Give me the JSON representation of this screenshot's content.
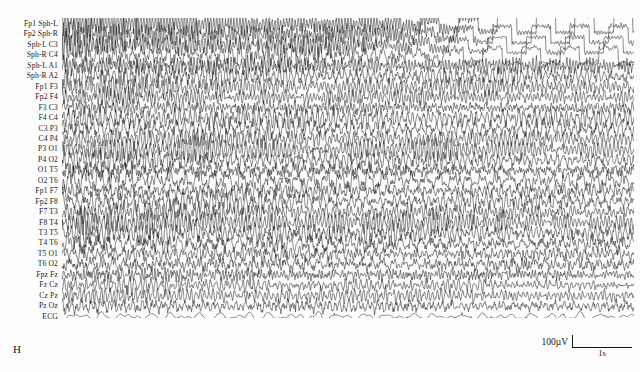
{
  "figure": {
    "panel_letter": "H",
    "modality": "EEG",
    "background_color": "#fdfdfd",
    "trace_color": "#1a1a1a"
  },
  "channels": [
    {
      "label": "Fp1 Sph-L"
    },
    {
      "label": "Fp2 Sph-R"
    },
    {
      "label": "Sph-L C3"
    },
    {
      "label": "Sph-R C4"
    },
    {
      "label": "Sph-L A1"
    },
    {
      "label": "Sph-R A2"
    },
    {
      "label": "Fp1 F3"
    },
    {
      "label": "Fp2 F4"
    },
    {
      "label": "F3 C3"
    },
    {
      "label": "F4 C4"
    },
    {
      "label": "C3 P3"
    },
    {
      "label": "C4 P4"
    },
    {
      "label": "P3 O1"
    },
    {
      "label": "P4 O2"
    },
    {
      "label": "O1 T5"
    },
    {
      "label": "O2 T6"
    },
    {
      "label": "Fp1 F7"
    },
    {
      "label": "Fp2 F8"
    },
    {
      "label": "F7 T3"
    },
    {
      "label": "F8 T4"
    },
    {
      "label": "T3 T5"
    },
    {
      "label": "T4 T6"
    },
    {
      "label": "T5 O1"
    },
    {
      "label": "T6 O2"
    },
    {
      "label": "Fpz Fz"
    },
    {
      "label": "Fz Cz"
    },
    {
      "label": "Cz Pz"
    },
    {
      "label": "Pz Oz"
    },
    {
      "label": "ECG"
    }
  ],
  "scale_bar": {
    "amplitude_label": "100µV",
    "time_label": "1s",
    "amplitude_value": 100,
    "amplitude_unit": "µV",
    "time_value": 1,
    "time_unit": "s"
  },
  "chart_data": {
    "type": "line",
    "title": "",
    "xlabel": "",
    "ylabel": "",
    "n_channels": 29,
    "epoch_seconds": 9.5,
    "series_labels": [
      "Fp1 Sph-L",
      "Fp2 Sph-R",
      "Sph-L C3",
      "Sph-R C4",
      "Sph-L A1",
      "Sph-R A2",
      "Fp1 F3",
      "Fp2 F4",
      "F3 C3",
      "F4 C4",
      "C3 P3",
      "C4 P4",
      "P3 O1",
      "P4 O2",
      "O1 T5",
      "O2 T6",
      "Fp1 F7",
      "Fp2 F8",
      "F7 T3",
      "F8 T4",
      "T3 T5",
      "T4 T6",
      "T5 O1",
      "T6 O2",
      "Fpz Fz",
      "Fz Cz",
      "Cz Pz",
      "Pz Oz",
      "ECG"
    ],
    "channel_profiles": [
      {
        "name": "Fp1 Sph-L",
        "amplitude": 5.6,
        "frequency": 10.5,
        "noise": 1.5,
        "clipping": true
      },
      {
        "name": "Fp2 Sph-R",
        "amplitude": 5.4,
        "frequency": 10.2,
        "noise": 1.5,
        "clipping": true
      },
      {
        "name": "Sph-L C3",
        "amplitude": 5.0,
        "frequency": 9.8,
        "noise": 1.4,
        "clipping": true
      },
      {
        "name": "Sph-R C4",
        "amplitude": 4.9,
        "frequency": 10.0,
        "noise": 1.4,
        "clipping": true
      },
      {
        "name": "Sph-L A1",
        "amplitude": 4.6,
        "frequency": 9.4,
        "noise": 1.3,
        "clipping": false
      },
      {
        "name": "Sph-R A2",
        "amplitude": 4.5,
        "frequency": 9.6,
        "noise": 1.3,
        "clipping": false
      },
      {
        "name": "Fp1 F3",
        "amplitude": 4.2,
        "frequency": 9.2,
        "noise": 1.2,
        "clipping": false
      },
      {
        "name": "Fp2 F4",
        "amplitude": 4.3,
        "frequency": 9.1,
        "noise": 1.2,
        "clipping": false
      },
      {
        "name": "F3 C3",
        "amplitude": 4.4,
        "frequency": 8.9,
        "noise": 1.2,
        "clipping": false
      },
      {
        "name": "F4 C4",
        "amplitude": 4.4,
        "frequency": 9.0,
        "noise": 1.2,
        "clipping": false
      },
      {
        "name": "C3 P3",
        "amplitude": 4.6,
        "frequency": 8.7,
        "noise": 1.3,
        "clipping": false
      },
      {
        "name": "C4 P4",
        "amplitude": 4.6,
        "frequency": 8.8,
        "noise": 1.3,
        "clipping": false
      },
      {
        "name": "P3 O1",
        "amplitude": 4.8,
        "frequency": 8.5,
        "noise": 1.3,
        "clipping": false
      },
      {
        "name": "P4 O2",
        "amplitude": 4.8,
        "frequency": 8.6,
        "noise": 1.3,
        "clipping": false
      },
      {
        "name": "O1 T5",
        "amplitude": 5.0,
        "frequency": 8.4,
        "noise": 1.4,
        "clipping": false
      },
      {
        "name": "O2 T6",
        "amplitude": 5.0,
        "frequency": 8.3,
        "noise": 1.4,
        "clipping": false
      },
      {
        "name": "Fp1 F7",
        "amplitude": 5.2,
        "frequency": 8.8,
        "noise": 1.4,
        "clipping": false
      },
      {
        "name": "Fp2 F8",
        "amplitude": 5.2,
        "frequency": 8.9,
        "noise": 1.4,
        "clipping": false
      },
      {
        "name": "F7 T3",
        "amplitude": 5.4,
        "frequency": 8.6,
        "noise": 1.5,
        "clipping": false
      },
      {
        "name": "F8 T4",
        "amplitude": 5.3,
        "frequency": 8.7,
        "noise": 1.5,
        "clipping": false
      },
      {
        "name": "T3 T5",
        "amplitude": 5.4,
        "frequency": 8.2,
        "noise": 1.5,
        "clipping": false
      },
      {
        "name": "T4 T6",
        "amplitude": 5.3,
        "frequency": 8.3,
        "noise": 1.5,
        "clipping": false
      },
      {
        "name": "T5 O1",
        "amplitude": 5.1,
        "frequency": 8.1,
        "noise": 1.4,
        "clipping": false
      },
      {
        "name": "T6 O2",
        "amplitude": 5.0,
        "frequency": 8.2,
        "noise": 1.4,
        "clipping": false
      },
      {
        "name": "Fpz Fz",
        "amplitude": 4.4,
        "frequency": 8.9,
        "noise": 1.2,
        "clipping": false
      },
      {
        "name": "Fz Cz",
        "amplitude": 4.3,
        "frequency": 8.7,
        "noise": 1.2,
        "clipping": false
      },
      {
        "name": "Cz Pz",
        "amplitude": 4.2,
        "frequency": 8.5,
        "noise": 1.2,
        "clipping": false
      },
      {
        "name": "Pz Oz",
        "amplitude": 4.0,
        "frequency": 8.3,
        "noise": 1.1,
        "clipping": false
      },
      {
        "name": "ECG",
        "amplitude": 2.2,
        "frequency": 1.6,
        "noise": 0.4,
        "clipping": false
      }
    ]
  }
}
